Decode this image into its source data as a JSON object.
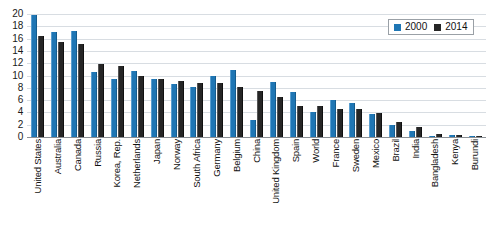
{
  "chart_data": {
    "type": "bar",
    "title": "",
    "xlabel": "",
    "ylabel": "",
    "ylim": [
      0,
      20
    ],
    "yticks": [
      20,
      18,
      16,
      14,
      12,
      10,
      8,
      6,
      4,
      2,
      0
    ],
    "grid": true,
    "legend_position": "top-right",
    "categories": [
      "United States",
      "Australia",
      "Canada",
      "Russia",
      "Korea, Rep.",
      "Netherlands",
      "Japan",
      "Norway",
      "South Africa",
      "Germany",
      "Belgium",
      "China",
      "United Kingdom",
      "Spain",
      "World",
      "France",
      "Sweden",
      "Mexico",
      "Brazil",
      "India",
      "Bangladesh",
      "Kenya",
      "Burundi"
    ],
    "series": [
      {
        "name": "2000",
        "color": "#1f76b4",
        "values": [
          19.9,
          17.1,
          17.3,
          10.5,
          9.5,
          10.7,
          9.5,
          8.6,
          8.1,
          9.9,
          10.9,
          2.7,
          9.0,
          7.3,
          4.1,
          6.1,
          5.5,
          3.8,
          1.9,
          0.9,
          0.2,
          0.3,
          0.05
        ]
      },
      {
        "name": "2014",
        "color": "#262626",
        "values": [
          16.5,
          15.4,
          15.1,
          11.9,
          11.6,
          9.9,
          9.5,
          9.1,
          8.8,
          8.8,
          8.2,
          7.5,
          6.5,
          5.0,
          5.0,
          4.6,
          4.5,
          3.9,
          2.5,
          1.7,
          0.45,
          0.3,
          0.05
        ]
      }
    ]
  },
  "legend": {
    "entries": [
      {
        "label": "2000"
      },
      {
        "label": "2014"
      }
    ]
  }
}
